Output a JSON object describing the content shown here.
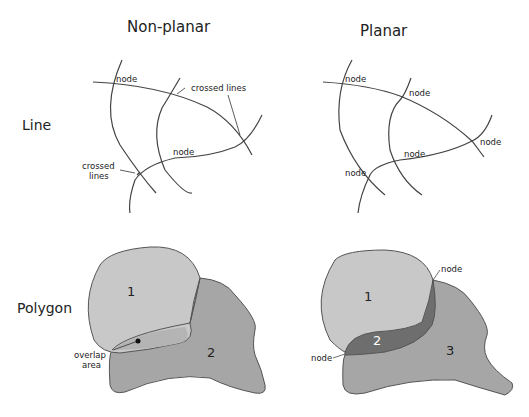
{
  "columns": {
    "nonplanar": "Non-planar",
    "planar": "Planar"
  },
  "rows": {
    "line": "Line",
    "polygon": "Polygon"
  },
  "nonplanar_line": {
    "node1": "node",
    "node2": "node",
    "crossed1": "crossed lines",
    "crossed2_a": "crossed",
    "crossed2_b": "lines"
  },
  "planar_line": {
    "nodes": [
      "node",
      "node",
      "node",
      "node",
      "node"
    ]
  },
  "nonplanar_polygon": {
    "poly1": "1",
    "poly2": "2",
    "overlap_a": "overlap",
    "overlap_b": "area"
  },
  "planar_polygon": {
    "poly1": "1",
    "poly2": "2",
    "poly3": "3",
    "node_top": "node",
    "node_left": "node"
  },
  "colors": {
    "light": "#c8c8c8",
    "mid": "#a6a6a6",
    "dark": "#6e6e6e",
    "stroke": "#444444"
  }
}
